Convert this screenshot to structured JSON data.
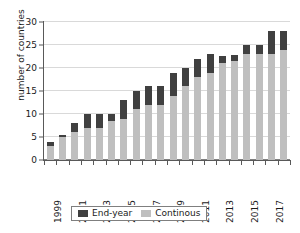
{
  "chart_data": {
    "type": "bar",
    "title": "",
    "subtitle": "",
    "xlabel": "",
    "ylabel": "number of countries",
    "stacked": true,
    "grid": true,
    "legend_position": "bottom",
    "ylim": [
      0,
      30
    ],
    "ytick_step": 5,
    "ytick_labels": [
      "0",
      "5",
      "10",
      "15",
      "20",
      "25",
      "30"
    ],
    "ytick_values": [
      0,
      5,
      10,
      15,
      20,
      25,
      30
    ],
    "categories": [
      "1999",
      "2000",
      "2001",
      "2002",
      "2003",
      "2004",
      "2005",
      "2006",
      "2007",
      "2008",
      "2009",
      "2010",
      "2011",
      "2012",
      "2013",
      "2014",
      "2015",
      "2016",
      "2017",
      "2018"
    ],
    "xtick_labels_shown": [
      "1999",
      "2001",
      "2003",
      "2005",
      "2007",
      "2009",
      "2011",
      "2013",
      "2015",
      "2017"
    ],
    "series": [
      {
        "name": "Continous",
        "color": "#bfbfbf",
        "values": [
          3,
          5,
          6,
          7,
          7,
          8.5,
          9,
          11,
          12,
          12,
          14,
          16,
          18,
          19,
          21,
          21.5,
          23,
          23,
          23,
          24
        ]
      },
      {
        "name": "End-year",
        "color": "#404040",
        "values": [
          1,
          0.5,
          2,
          3,
          3,
          1.5,
          4,
          4,
          4,
          4,
          5,
          4,
          4,
          4,
          1.7,
          1.3,
          2,
          2,
          5,
          4
        ]
      }
    ],
    "totals": [
      4,
      5.5,
      8,
      10,
      10,
      10,
      13,
      15,
      16,
      16,
      19,
      20,
      22,
      23,
      22.7,
      22.8,
      25,
      25,
      28,
      28
    ]
  },
  "legend": {
    "items": [
      {
        "label": "End-year",
        "color": "#404040"
      },
      {
        "label": "Continous",
        "color": "#bfbfbf"
      }
    ]
  },
  "colors": {
    "end_year": "#404040",
    "continous": "#bfbfbf",
    "axis": "#595959",
    "grid": "#d9d9d9",
    "text": "#1a1a1a",
    "background": "#ffffff"
  }
}
